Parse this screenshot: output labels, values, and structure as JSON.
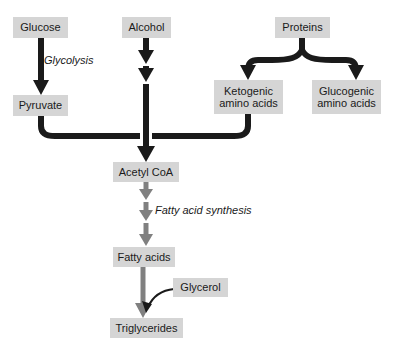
{
  "diagram": {
    "colors": {
      "box_fill": "#d5d5d5",
      "box_text": "#1a1a1a",
      "arrow_black": "#1a1a1a",
      "arrow_gray": "#808080",
      "background": "#ffffff"
    },
    "nodes": [
      {
        "id": "glucose",
        "label": "Glucose",
        "x": 13,
        "y": 17,
        "w": 55,
        "h": 21
      },
      {
        "id": "alcohol",
        "label": "Alcohol",
        "x": 122,
        "y": 17,
        "w": 49,
        "h": 21
      },
      {
        "id": "proteins",
        "label": "Proteins",
        "x": 275,
        "y": 17,
        "w": 55,
        "h": 21
      },
      {
        "id": "pyruvate",
        "label": "Pyruvate",
        "x": 13,
        "y": 95,
        "w": 55,
        "h": 21
      },
      {
        "id": "ketogenic",
        "label": "Ketogenic\namino acids",
        "x": 214,
        "y": 80,
        "w": 69,
        "h": 34
      },
      {
        "id": "glucogenic",
        "label": "Glucogenic\namino acids",
        "x": 312,
        "y": 80,
        "w": 69,
        "h": 34
      },
      {
        "id": "acetyl-coa",
        "label": "Acetyl CoA",
        "x": 113,
        "y": 162,
        "w": 66,
        "h": 20
      },
      {
        "id": "fatty-acids",
        "label": "Fatty acids",
        "x": 113,
        "y": 247,
        "w": 62,
        "h": 20
      },
      {
        "id": "glycerol",
        "label": "Glycerol",
        "x": 173,
        "y": 278,
        "w": 55,
        "h": 19
      },
      {
        "id": "triglycerides",
        "label": "Triglycerides",
        "x": 110,
        "y": 318,
        "w": 73,
        "h": 20
      }
    ],
    "edge_labels": [
      {
        "id": "glycolysis",
        "text": "Glycolysis",
        "x": 44,
        "y": 54
      },
      {
        "id": "fatty-acid-synthesis",
        "text": "Fatty acid synthesis",
        "x": 155,
        "y": 204
      }
    ],
    "edges": [
      {
        "id": "glucose-to-pyruvate",
        "from": "glucose",
        "to": "pyruvate",
        "style": "straight-arrow",
        "color": "black"
      },
      {
        "id": "alcohol-to-junction",
        "from": "alcohol",
        "to": "acetyl-coa",
        "style": "segmented-arrow",
        "color": "black"
      },
      {
        "id": "proteins-to-ketogenic",
        "from": "proteins",
        "to": "ketogenic",
        "style": "branch-arrow",
        "color": "black"
      },
      {
        "id": "proteins-to-glucogenic",
        "from": "proteins",
        "to": "glucogenic",
        "style": "branch-arrow",
        "color": "black"
      },
      {
        "id": "pyruvate-to-junction",
        "from": "pyruvate",
        "to": "acetyl-coa",
        "style": "elbow",
        "color": "black"
      },
      {
        "id": "ketogenic-to-junction",
        "from": "ketogenic",
        "to": "acetyl-coa",
        "style": "elbow",
        "color": "black"
      },
      {
        "id": "acetyl-to-fatty-acids",
        "from": "acetyl-coa",
        "to": "fatty-acids",
        "style": "triple-arrow",
        "color": "gray"
      },
      {
        "id": "fatty-acids-to-triglycerides",
        "from": "fatty-acids",
        "to": "triglycerides",
        "style": "straight-arrow",
        "color": "gray"
      },
      {
        "id": "glycerol-to-triglycerides",
        "from": "glycerol",
        "to": "triglycerides",
        "style": "curved-arrow",
        "color": "black"
      }
    ]
  }
}
